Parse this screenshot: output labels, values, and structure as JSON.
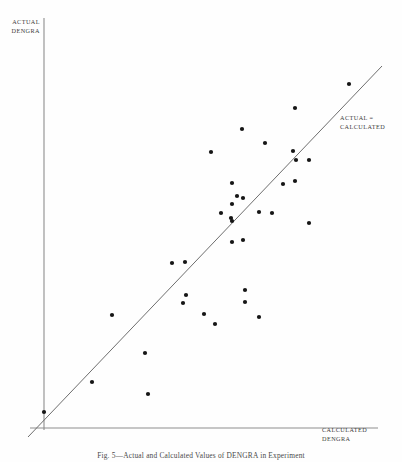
{
  "figure": {
    "caption": "Fig. 5—Actual and Calculated Values of DENGRA in Experiment",
    "y_axis_label_line1": "ACTUAL",
    "y_axis_label_line2": "DENGRA",
    "x_axis_label_line1": "CALCULATED",
    "x_axis_label_line2": "DENGRA",
    "reference_line_label_line1": "ACTUAL =",
    "reference_line_label_line2": "CALCULATED",
    "colors": {
      "background": "#fefefe",
      "axis": "#8d8d8d",
      "reference_line": "#6e6e6e",
      "marker": "#151515",
      "text": "#3a3a3a"
    }
  },
  "chart_data": {
    "type": "scatter",
    "title": "Fig. 5—Actual and Calculated Values of DENGRA in Experiment",
    "xlabel": "CALCULATED DENGRA",
    "ylabel": "ACTUAL DENGRA",
    "grid": false,
    "legend": false,
    "axis_ticks": false,
    "xlim": [
      44,
      378
    ],
    "ylim": [
      18,
      428
    ],
    "annotations": [
      {
        "text": "ACTUAL = CALCULATED",
        "kind": "reference-line-label",
        "x": 340,
        "y": 114
      }
    ],
    "series": [
      {
        "name": "ACTUAL vs CALCULATED DENGRA",
        "marker": "filled-circle",
        "marker_size": 4.2,
        "color": "#151515",
        "points": [
          [
            44,
            412
          ],
          [
            92,
            382
          ],
          [
            148,
            394
          ],
          [
            145,
            353
          ],
          [
            112,
            315
          ],
          [
            172,
            263
          ],
          [
            185,
            262
          ],
          [
            186,
            295
          ],
          [
            183,
            303
          ],
          [
            204,
            314
          ],
          [
            215,
            324
          ],
          [
            245,
            290
          ],
          [
            245,
            302
          ],
          [
            259,
            317
          ],
          [
            211,
            152
          ],
          [
            232,
            183
          ],
          [
            242,
            129
          ],
          [
            265,
            143
          ],
          [
            237,
            196
          ],
          [
            243,
            198
          ],
          [
            232,
            204
          ],
          [
            221,
            213
          ],
          [
            231,
            218
          ],
          [
            259,
            212
          ],
          [
            272,
            213
          ],
          [
            232,
            221
          ],
          [
            232,
            242
          ],
          [
            243,
            240
          ],
          [
            293,
            151
          ],
          [
            296,
            160
          ],
          [
            283,
            184
          ],
          [
            295,
            181
          ],
          [
            309,
            160
          ],
          [
            309,
            223
          ],
          [
            349,
            84
          ],
          [
            295,
            108
          ]
        ]
      }
    ],
    "reference_line": {
      "label": "ACTUAL = CALCULATED",
      "slope_description": "identity line (y = x)",
      "x_start": 28,
      "y_start": 437,
      "x_end": 382,
      "y_end": 66,
      "color": "#6e6e6e"
    },
    "axes": {
      "y_axis": {
        "x": 44,
        "y_top": 18,
        "y_bottom": 430,
        "color": "#8d8d8d"
      },
      "x_axis": {
        "y": 428,
        "x_left": 30,
        "x_right": 378,
        "color": "#8d8d8d"
      }
    }
  }
}
